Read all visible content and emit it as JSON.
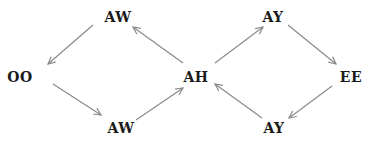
{
  "diagram": {
    "type": "state-cycle-graph",
    "edge_color": "#8a8a8a",
    "nodes": [
      {
        "id": "aw_top",
        "label": "AW",
        "x": 118,
        "y": 17
      },
      {
        "id": "oo",
        "label": "OO",
        "x": 20,
        "y": 77
      },
      {
        "id": "aw_bottom",
        "label": "AW",
        "x": 121,
        "y": 128
      },
      {
        "id": "ah",
        "label": "AH",
        "x": 196,
        "y": 77
      },
      {
        "id": "ay_top",
        "label": "AY",
        "x": 273,
        "y": 17
      },
      {
        "id": "ee",
        "label": "EE",
        "x": 351,
        "y": 77
      },
      {
        "id": "ay_bottom",
        "label": "AY",
        "x": 274,
        "y": 128
      }
    ],
    "edges": [
      {
        "from": "aw_top",
        "to": "oo",
        "x1": 93,
        "y1": 25,
        "x2": 48,
        "y2": 64
      },
      {
        "from": "oo",
        "to": "aw_bottom",
        "x1": 53,
        "y1": 84,
        "x2": 101,
        "y2": 115
      },
      {
        "from": "aw_bottom",
        "to": "ah",
        "x1": 136,
        "y1": 120,
        "x2": 183,
        "y2": 88
      },
      {
        "from": "ah",
        "to": "aw_top",
        "x1": 183,
        "y1": 63,
        "x2": 133,
        "y2": 27
      },
      {
        "from": "ah",
        "to": "ay_top",
        "x1": 215,
        "y1": 63,
        "x2": 263,
        "y2": 27
      },
      {
        "from": "ay_top",
        "to": "ee",
        "x1": 288,
        "y1": 25,
        "x2": 336,
        "y2": 64
      },
      {
        "from": "ee",
        "to": "ay_bottom",
        "x1": 332,
        "y1": 86,
        "x2": 289,
        "y2": 118
      },
      {
        "from": "ay_bottom",
        "to": "ah",
        "x1": 262,
        "y1": 118,
        "x2": 215,
        "y2": 84
      }
    ]
  }
}
